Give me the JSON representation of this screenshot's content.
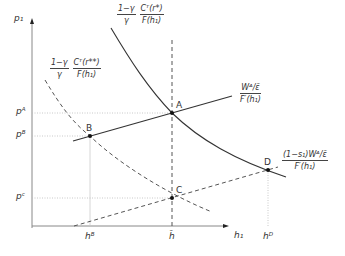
{
  "axes": {
    "y_label": "p₁",
    "x_label": "h₁"
  },
  "y_ticks": [
    {
      "label": "pᴬ"
    },
    {
      "label": "pᴮ"
    },
    {
      "label": "pᶜ"
    }
  ],
  "x_ticks": [
    {
      "label": "hᴮ"
    },
    {
      "label": "h̄"
    },
    {
      "label": "hᴰ"
    }
  ],
  "points": {
    "A": "A",
    "B": "B",
    "C": "C",
    "D": "D"
  },
  "curves": {
    "solid_curve": {
      "coef_num": "1−γ",
      "coef_den": "γ",
      "num": "Cᵀ(r*)",
      "den": "F(h₁)"
    },
    "dashed_curve": {
      "coef_num": "1−γ",
      "coef_den": "γ",
      "num": "Cᵀ(r**)",
      "den": "F(h₁)"
    },
    "solid_line": {
      "num": "Wᴬ/ε̄",
      "den": "F′(h₁)"
    },
    "dashed_line": {
      "num": "(1−s₁)Wᴬ/ε̄",
      "den": "F′(h₁)"
    }
  }
}
